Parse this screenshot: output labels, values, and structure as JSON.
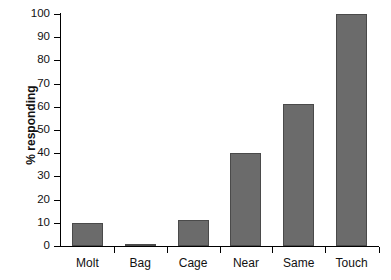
{
  "chart_data": {
    "type": "bar",
    "title": "",
    "subtitle": "",
    "xlabel": "",
    "ylabel": "% responding",
    "categories": [
      "Molt",
      "Bag",
      "Cage",
      "Near",
      "Same",
      "Touch"
    ],
    "values": [
      10,
      0.5,
      11,
      40,
      61,
      100
    ],
    "series": [
      {
        "name": "% responding",
        "values": [
          10,
          0.5,
          11,
          40,
          61,
          100
        ]
      }
    ],
    "ylim": [
      0,
      100
    ],
    "ytick_labels": [
      "0",
      "10",
      "20",
      "30",
      "40",
      "50",
      "60",
      "70",
      "80",
      "90",
      "100"
    ],
    "ytick_values": [
      0,
      10,
      20,
      30,
      40,
      50,
      60,
      70,
      80,
      90,
      100
    ],
    "grid": false,
    "legend": false,
    "legend_position": "none",
    "bar_color": "#6b6b6b",
    "bar_edge_color": "#4a4a4a",
    "axis_color": "#000000",
    "background_color": "#ffffff"
  }
}
